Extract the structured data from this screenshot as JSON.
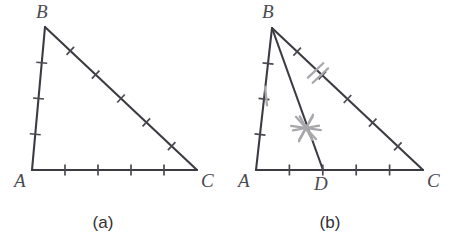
{
  "figure": {
    "background_color": "#ffffff",
    "stroke_color": "#3b3b42",
    "tick_color": "#4a4a52",
    "annotation_color": "#a8a8ac",
    "label_color": "#4a4a52"
  },
  "panels": [
    {
      "id": "panel-a",
      "caption": "(a)",
      "vertices": [
        {
          "name": "A",
          "label": "A",
          "x": 32,
          "y": 170,
          "label_x": 14,
          "label_y": 187
        },
        {
          "name": "B",
          "label": "B",
          "x": 45,
          "y": 27,
          "label_x": 36,
          "label_y": 18
        },
        {
          "name": "C",
          "label": "C",
          "x": 197,
          "y": 170,
          "label_x": 201,
          "label_y": 187
        }
      ],
      "edges": [
        {
          "name": "AB",
          "from": "A",
          "to": "B",
          "tick_count": 3,
          "tick_style": "single"
        },
        {
          "name": "AC",
          "from": "A",
          "to": "C",
          "tick_count": 4,
          "tick_style": "single"
        },
        {
          "name": "BC",
          "from": "B",
          "to": "C",
          "tick_count": 5,
          "tick_style": "single"
        }
      ],
      "cevian": null,
      "annotations": []
    },
    {
      "id": "panel-b",
      "caption": "(b)",
      "vertices": [
        {
          "name": "A",
          "label": "A",
          "x": 256,
          "y": 170,
          "label_x": 238,
          "label_y": 187
        },
        {
          "name": "B",
          "label": "B",
          "x": 272,
          "y": 28,
          "label_x": 262,
          "label_y": 18
        },
        {
          "name": "C",
          "label": "C",
          "x": 423,
          "y": 170,
          "label_x": 427,
          "label_y": 187
        },
        {
          "name": "D",
          "label": "D",
          "x": 323,
          "y": 170,
          "label_x": 314,
          "label_y": 190
        }
      ],
      "edges": [
        {
          "name": "AB",
          "from": "A",
          "to": "B",
          "tick_count": 3,
          "tick_style": "single"
        },
        {
          "name": "AC",
          "from": "A",
          "to": "C",
          "tick_count": 4,
          "tick_style": "single"
        },
        {
          "name": "BC",
          "from": "B",
          "to": "C",
          "tick_count": 5,
          "tick_style": "single"
        }
      ],
      "cevian": {
        "name": "BD",
        "from": "B",
        "to": "D"
      },
      "annotations": [
        {
          "name": "gray-single-tick-on-AB",
          "type": "tick-single",
          "x": 266,
          "y": 96,
          "angle": 84,
          "length": 19
        },
        {
          "name": "gray-double-tick-on-BC",
          "type": "tick-double",
          "x": 318,
          "y": 73,
          "angle": 137,
          "length": 21,
          "gap": 7
        },
        {
          "name": "gray-angle-star-on-BD",
          "type": "star",
          "x": 306,
          "y": 128,
          "radius": 15
        }
      ]
    }
  ],
  "captions": [
    {
      "name": "caption-a",
      "text": "(a)",
      "x": 103,
      "y": 228
    },
    {
      "name": "caption-b",
      "text": "(b)",
      "x": 330,
      "y": 228
    }
  ]
}
